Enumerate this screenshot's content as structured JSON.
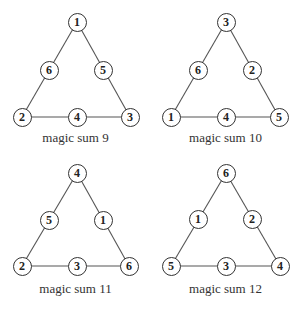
{
  "figure": {
    "diagrams": [
      {
        "caption": "magic sum 9",
        "magic_sum": 9,
        "nodes": {
          "top": "1",
          "left_mid": "6",
          "right_mid": "5",
          "bottom_left": "2",
          "bottom_mid": "4",
          "bottom_right": "3"
        }
      },
      {
        "caption": "magic sum 10",
        "magic_sum": 10,
        "nodes": {
          "top": "3",
          "left_mid": "6",
          "right_mid": "2",
          "bottom_left": "1",
          "bottom_mid": "4",
          "bottom_right": "5"
        }
      },
      {
        "caption": "magic sum 11",
        "magic_sum": 11,
        "nodes": {
          "top": "4",
          "left_mid": "5",
          "right_mid": "1",
          "bottom_left": "2",
          "bottom_mid": "3",
          "bottom_right": "6"
        }
      },
      {
        "caption": "magic sum 12",
        "magic_sum": 12,
        "nodes": {
          "top": "6",
          "left_mid": "1",
          "right_mid": "2",
          "bottom_left": "5",
          "bottom_mid": "3",
          "bottom_right": "4"
        }
      }
    ]
  }
}
